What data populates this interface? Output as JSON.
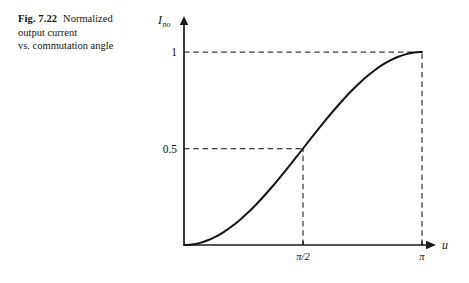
{
  "caption": {
    "figure_label": "Fig. 7.22",
    "text": "Normalized output current vs. commutation angle",
    "line1": "Normalized",
    "line2": "output current",
    "line3": "vs. commutation angle"
  },
  "chart_data": {
    "type": "line",
    "title": "Normalized output current vs. commutation angle",
    "xlabel": "u",
    "ylabel": "Ino",
    "ylabel_base": "I",
    "ylabel_subscript": "no",
    "xlim": [
      0,
      3.14159
    ],
    "ylim": [
      0,
      1.06
    ],
    "grid": false,
    "legend": false,
    "equation": "(1 - cos(u)) / 2",
    "x_ticks": [
      {
        "value": 1.5708,
        "label": "π/2"
      },
      {
        "value": 3.14159,
        "label": "π"
      }
    ],
    "y_ticks": [
      {
        "value": 0.5,
        "label": "0.5"
      },
      {
        "value": 1.0,
        "label": "1"
      }
    ],
    "guide_lines": [
      {
        "name": "horizontal-at-1",
        "from": [
          0,
          1.0
        ],
        "to": [
          3.14159,
          1.0
        ],
        "style": "dashed"
      },
      {
        "name": "vertical-at-pi",
        "from": [
          3.14159,
          0
        ],
        "to": [
          3.14159,
          1.0
        ],
        "style": "dashed"
      },
      {
        "name": "horizontal-at-half",
        "from": [
          0,
          0.5
        ],
        "to": [
          1.5708,
          0.5
        ],
        "style": "dashed"
      },
      {
        "name": "vertical-at-half-pi",
        "from": [
          1.5708,
          0
        ],
        "to": [
          1.5708,
          0.5
        ],
        "style": "dashed"
      }
    ],
    "annotated_points": [
      {
        "x": 1.5708,
        "y": 0.5,
        "x_label": "π/2",
        "y_label": "0.5"
      },
      {
        "x": 3.14159,
        "y": 1.0,
        "x_label": "π",
        "y_label": "1"
      }
    ],
    "x": [
      0.0,
      0.1047,
      0.2094,
      0.3142,
      0.4189,
      0.5236,
      0.6283,
      0.733,
      0.8378,
      0.9425,
      1.0472,
      1.1519,
      1.2566,
      1.3614,
      1.4661,
      1.5708,
      1.6755,
      1.7802,
      1.885,
      1.9897,
      2.0944,
      2.1991,
      2.3038,
      2.4086,
      2.5133,
      2.618,
      2.7227,
      2.8274,
      2.9322,
      3.0369,
      3.1416
    ],
    "values": [
      0.0,
      0.0027,
      0.0109,
      0.0245,
      0.0432,
      0.067,
      0.0955,
      0.1284,
      0.1654,
      0.2061,
      0.25,
      0.2966,
      0.3455,
      0.396,
      0.4477,
      0.5,
      0.5523,
      0.604,
      0.6545,
      0.7034,
      0.75,
      0.7939,
      0.8346,
      0.8716,
      0.9045,
      0.933,
      0.9568,
      0.9755,
      0.9891,
      0.9973,
      1.0
    ]
  },
  "colors": {
    "ink": "#141414",
    "axis": "#1a1a1a",
    "guide": "#3b3b3b",
    "background": "#ffffff"
  }
}
